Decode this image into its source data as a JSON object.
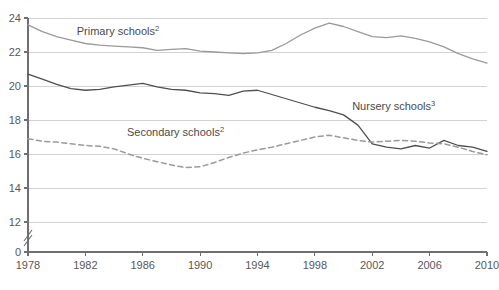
{
  "chart_data": {
    "type": "line",
    "title": "",
    "subtitle": "",
    "xlabel": "",
    "ylabel": "",
    "x": [
      1978,
      1979,
      1980,
      1981,
      1982,
      1983,
      1984,
      1985,
      1986,
      1987,
      1988,
      1989,
      1990,
      1991,
      1992,
      1993,
      1994,
      1995,
      1996,
      1997,
      1998,
      1999,
      2000,
      2001,
      2002,
      2003,
      2004,
      2005,
      2006,
      2007,
      2008,
      2009,
      2010
    ],
    "xlim": [
      1978,
      2010
    ],
    "ylim": [
      12,
      24
    ],
    "y_axis_break": true,
    "y_axis_break_label": "0",
    "grid": true,
    "grid_axis": "y",
    "legend_position": "inline-annotations",
    "xticks": [
      "1978",
      "1982",
      "1986",
      "1990",
      "1994",
      "1998",
      "2002",
      "2006",
      "2010"
    ],
    "xtick_values": [
      1978,
      1982,
      1986,
      1990,
      1994,
      1998,
      2002,
      2006,
      2010
    ],
    "yticks": [
      "0",
      "12",
      "14",
      "16",
      "18",
      "20",
      "22",
      "24"
    ],
    "ytick_values": [
      0,
      12,
      14,
      16,
      18,
      20,
      22,
      24
    ],
    "series": [
      {
        "name": "Primary schools",
        "footnote": "2",
        "label_text": "Primary schools",
        "style": "solid",
        "color": "#9a9a9a",
        "width": 1.3,
        "label_x": 1981.4,
        "label_y": 23.0,
        "values": [
          23.6,
          23.2,
          22.9,
          22.7,
          22.5,
          22.4,
          22.35,
          22.3,
          22.25,
          22.1,
          22.15,
          22.2,
          22.05,
          22.0,
          21.95,
          21.9,
          21.95,
          22.1,
          22.5,
          23.0,
          23.4,
          23.7,
          23.5,
          23.2,
          22.9,
          22.85,
          22.95,
          22.8,
          22.6,
          22.3,
          21.9,
          21.6,
          21.35
        ]
      },
      {
        "name": "Nursery schools",
        "footnote": "3",
        "label_text": "Nursery schools",
        "style": "solid",
        "color": "#4f4f51",
        "width": 1.3,
        "label_x": 2000.6,
        "label_y": 18.6,
        "values": [
          20.7,
          20.4,
          20.1,
          19.85,
          19.75,
          19.8,
          19.95,
          20.05,
          20.15,
          19.95,
          19.8,
          19.75,
          19.6,
          19.55,
          19.45,
          19.7,
          19.75,
          19.5,
          19.25,
          19.0,
          18.75,
          18.55,
          18.3,
          17.7,
          16.6,
          16.4,
          16.3,
          16.5,
          16.35,
          16.8,
          16.5,
          16.4,
          16.15
        ]
      },
      {
        "name": "Secondary schools",
        "footnote": "2",
        "label_text": "Secondary schools",
        "style": "dashed",
        "color": "#9a9a9a",
        "width": 1.5,
        "dash": "5,3.5",
        "label_x": 1984.9,
        "label_y": 17.05,
        "values": [
          16.9,
          16.75,
          16.7,
          16.6,
          16.5,
          16.45,
          16.3,
          16.0,
          15.75,
          15.55,
          15.35,
          15.2,
          15.25,
          15.5,
          15.8,
          16.05,
          16.25,
          16.4,
          16.6,
          16.8,
          17.0,
          17.1,
          16.95,
          16.8,
          16.7,
          16.75,
          16.8,
          16.75,
          16.65,
          16.6,
          16.4,
          16.15,
          15.95
        ]
      }
    ]
  }
}
